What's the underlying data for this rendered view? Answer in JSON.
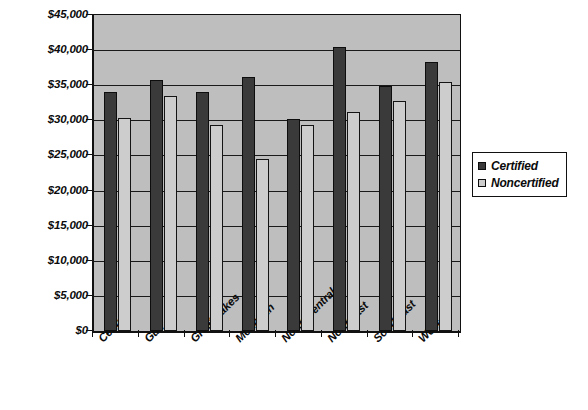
{
  "chart_data": {
    "type": "bar",
    "title": "",
    "subtitle": "",
    "xlabel": "",
    "ylabel": "",
    "ylim": [
      0,
      45000
    ],
    "ytick_step": 5000,
    "ytick_labels": [
      "$45,000",
      "$40,000",
      "$35,000",
      "$30,000",
      "$25,000",
      "$20,000",
      "$15,000",
      "$10,000",
      "$5,000",
      "$0"
    ],
    "ytick_values": [
      45000,
      40000,
      35000,
      30000,
      25000,
      20000,
      15000,
      10000,
      5000,
      0
    ],
    "grid": true,
    "grid_axis": "y",
    "legend_position": "right",
    "categories": [
      "Central",
      "Gulf",
      "Great Lakes",
      "Mountain",
      "North Central",
      "Northeast",
      "Southeast",
      "West"
    ],
    "series": [
      {
        "name": "Certified",
        "color": "#3a3a3a",
        "values": [
          34000,
          35800,
          34100,
          36100,
          30200,
          40500,
          34900,
          38300
        ]
      },
      {
        "name": "Noncertified",
        "color": "#cdcdcd",
        "values": [
          30300,
          33400,
          29300,
          24500,
          29300,
          31200,
          32800,
          35500
        ]
      }
    ]
  },
  "legend": {
    "items": [
      {
        "label": "Certified",
        "swatch": "dark-square-icon"
      },
      {
        "label": "Noncertified",
        "swatch": "light-square-icon"
      }
    ]
  },
  "colors": {
    "plot_background": "#bebebe",
    "page_background": "#ffffff",
    "axis": "#111111",
    "gridline": "#1a1a1a",
    "certified": "#3a3a3a",
    "noncertified": "#cdcdcd"
  }
}
